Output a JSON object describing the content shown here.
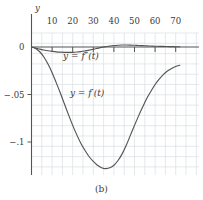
{
  "figure": {
    "caption": "(b)",
    "y_axis_title": "y",
    "origin_label": "0"
  },
  "labels": {
    "curve_fprime": "y = f′(t)",
    "curve_fdoubleprime": "y = f″(t)"
  },
  "colors": {
    "curve": "#555555",
    "axis": "#555555",
    "grid": "#d9dfe2",
    "text": "#3a3a3a",
    "background": "#ffffff"
  },
  "chart_data": {
    "type": "line",
    "title": "",
    "subtitle": "",
    "xlabel": "",
    "ylabel": "y",
    "caption": "(b)",
    "grid": true,
    "legend": "inline-annotations",
    "xlim": [
      0,
      73
    ],
    "ylim": [
      -0.138,
      0.008
    ],
    "xticks": [
      10,
      20,
      30,
      40,
      50,
      60,
      70
    ],
    "xtick_labels": [
      "10",
      "20",
      "30",
      "40",
      "50",
      "60",
      "70"
    ],
    "yticks": [
      0,
      -0.05,
      -0.1
    ],
    "ytick_labels": [
      "0",
      "−.05",
      "−.1"
    ],
    "series": [
      {
        "name": "y = f′(t)",
        "label_position": {
          "x": 27,
          "y": -0.052
        },
        "x": [
          0,
          2,
          4,
          6,
          8,
          10,
          12,
          14,
          16,
          18,
          20,
          22,
          24,
          26,
          28,
          30,
          32,
          34,
          35,
          36,
          38,
          40,
          42,
          44,
          46,
          48,
          50,
          52,
          54,
          56,
          58,
          60,
          62,
          64,
          66,
          68,
          70,
          72
        ],
        "values": [
          0,
          -0.0015,
          -0.005,
          -0.0105,
          -0.018,
          -0.027,
          -0.0375,
          -0.0485,
          -0.06,
          -0.0715,
          -0.0825,
          -0.0925,
          -0.1015,
          -0.109,
          -0.1155,
          -0.1205,
          -0.1245,
          -0.1272,
          -0.1278,
          -0.128,
          -0.1272,
          -0.1245,
          -0.1195,
          -0.1125,
          -0.1035,
          -0.093,
          -0.0825,
          -0.0725,
          -0.063,
          -0.054,
          -0.0465,
          -0.0395,
          -0.0338,
          -0.029,
          -0.0253,
          -0.0225,
          -0.0205,
          -0.0192
        ]
      },
      {
        "name": "y = f″(t)",
        "label_position": {
          "x": 24,
          "y": -0.0125
        },
        "x": [
          0,
          2,
          4,
          6,
          8,
          10,
          12,
          14,
          16,
          18,
          20,
          22,
          24,
          26,
          28,
          30,
          32,
          34,
          35,
          36,
          38,
          40,
          42,
          44,
          46,
          48,
          50,
          52,
          54,
          56,
          58,
          60,
          62,
          64,
          66,
          68,
          70,
          72
        ],
        "values": [
          0,
          -0.0012,
          -0.0022,
          -0.0032,
          -0.004,
          -0.0046,
          -0.0051,
          -0.0054,
          -0.0056,
          -0.0057,
          -0.0056,
          -0.0053,
          -0.0048,
          -0.0041,
          -0.0033,
          -0.0024,
          -0.0014,
          -0.0004,
          0.0,
          0.0004,
          0.0011,
          0.0016,
          0.0019,
          0.0021,
          0.0021,
          0.002,
          0.0018,
          0.0016,
          0.0014,
          0.0012,
          0.001,
          0.0008,
          0.0007,
          0.0006,
          0.0005,
          0.0004,
          0.0003,
          0.0003
        ]
      }
    ]
  }
}
